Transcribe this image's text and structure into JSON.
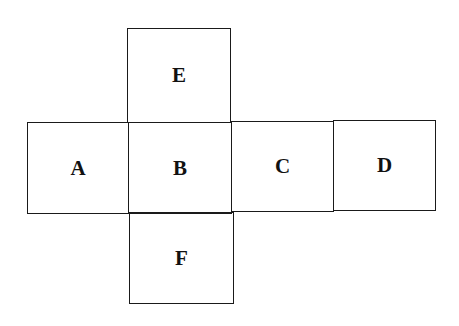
{
  "diagram": {
    "type": "cube-net",
    "faces": [
      {
        "id": "E",
        "label": "E"
      },
      {
        "id": "A",
        "label": "A"
      },
      {
        "id": "B",
        "label": "B"
      },
      {
        "id": "C",
        "label": "C"
      },
      {
        "id": "D",
        "label": "D"
      },
      {
        "id": "F",
        "label": "F"
      }
    ]
  }
}
